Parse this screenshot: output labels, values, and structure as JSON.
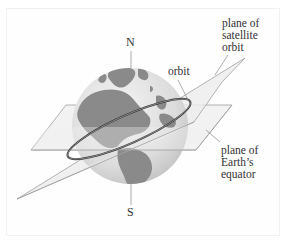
{
  "diagram": {
    "labels": {
      "north": "N",
      "south": "S",
      "orbit": "orbit",
      "satellite_plane_line1": "plane of",
      "satellite_plane_line2": "satellite",
      "satellite_plane_line3": "orbit",
      "equator_plane_line1": "plane of",
      "equator_plane_line2": "Earth’s",
      "equator_plane_line3": "equator"
    },
    "colors": {
      "background": "#ffffff",
      "globe_ocean": "#e6e6e6",
      "globe_land": "#8c8c8c",
      "plane_fill": "#efefef",
      "plane_edge": "#9a9a9a",
      "orbit_ring": "#333333",
      "text": "#333333"
    }
  }
}
